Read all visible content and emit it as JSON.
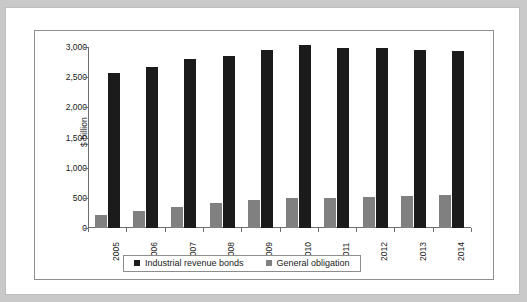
{
  "chart_data": {
    "type": "bar",
    "title": "",
    "xlabel": "",
    "ylabel": "$ billion",
    "ylim": [
      0,
      3000
    ],
    "ytick_labels": [
      "0",
      "500",
      "1,000",
      "1,500",
      "2,000",
      "2,500",
      "3,000"
    ],
    "ytick_values": [
      0,
      500,
      1000,
      1500,
      2000,
      2500,
      3000
    ],
    "categories": [
      "2005",
      "2006",
      "2007",
      "2008",
      "2009",
      "2010",
      "2011",
      "2012",
      "2013",
      "2014"
    ],
    "grid": false,
    "legend_position": "bottom",
    "series": [
      {
        "name": "Industrial revenue bonds",
        "color": "#1b1b1b",
        "values": [
          2570,
          2675,
          2800,
          2855,
          2950,
          3030,
          2985,
          2980,
          2945,
          2935
        ]
      },
      {
        "name": "General obligation",
        "color": "#808080",
        "values": [
          220,
          275,
          350,
          420,
          460,
          495,
          505,
          520,
          535,
          540
        ]
      }
    ]
  },
  "legend": {
    "items": [
      {
        "label": "Industrial revenue bonds"
      },
      {
        "label": "General obligation"
      }
    ]
  },
  "colors": {
    "series_a": "#1b1b1b",
    "series_b": "#808080",
    "axis": "#6e6e6e",
    "chart_border": "#8d8d8d",
    "page_background": "#c9c9c9",
    "content_background": "#ffffff"
  }
}
